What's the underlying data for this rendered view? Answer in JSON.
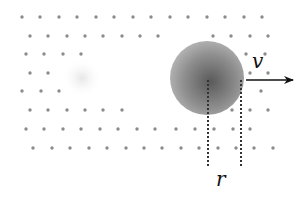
{
  "diagram": {
    "type": "physics-schematic",
    "labels": {
      "velocity": "v",
      "radius": "r"
    },
    "colors": {
      "background": "#ffffff",
      "particle": "#8c8c8c",
      "sphere_center": "#5a5a5a",
      "sphere_edge": "#b4b4b4",
      "ghost": "#ececec",
      "arrow": "#111111",
      "dashed_line": "#333333"
    },
    "sphere": {
      "cx": 207,
      "cy": 78,
      "r": 37
    },
    "ghost": {
      "cx": 82,
      "cy": 78,
      "r": 20
    },
    "arrow": {
      "x1": 246,
      "y1": 80,
      "x2": 293,
      "y2": 80
    },
    "dashed_lines": [
      {
        "x": 208,
        "y1": 80,
        "y2": 168
      },
      {
        "x": 241,
        "y1": 80,
        "y2": 168
      }
    ],
    "particles": [
      [
        22,
        17
      ],
      [
        40,
        17
      ],
      [
        59,
        17
      ],
      [
        77,
        17
      ],
      [
        96,
        17
      ],
      [
        114,
        17
      ],
      [
        133,
        17
      ],
      [
        151,
        17
      ],
      [
        170,
        17
      ],
      [
        188,
        17
      ],
      [
        207,
        17
      ],
      [
        225,
        17
      ],
      [
        244,
        17
      ],
      [
        262,
        17
      ],
      [
        30,
        36
      ],
      [
        48,
        36
      ],
      [
        67,
        36
      ],
      [
        85,
        36
      ],
      [
        103,
        36
      ],
      [
        122,
        36
      ],
      [
        140,
        36
      ],
      [
        158,
        36
      ],
      [
        213,
        36
      ],
      [
        231,
        36
      ],
      [
        250,
        36
      ],
      [
        268,
        36
      ],
      [
        26,
        54
      ],
      [
        44,
        54
      ],
      [
        63,
        54
      ],
      [
        81,
        54
      ],
      [
        246,
        54
      ],
      [
        265,
        54
      ],
      [
        30,
        73
      ],
      [
        48,
        73
      ],
      [
        250,
        73
      ],
      [
        268,
        73
      ],
      [
        22,
        91
      ],
      [
        41,
        91
      ],
      [
        59,
        91
      ],
      [
        261,
        91
      ],
      [
        30,
        110
      ],
      [
        48,
        110
      ],
      [
        67,
        110
      ],
      [
        85,
        110
      ],
      [
        103,
        110
      ],
      [
        122,
        110
      ],
      [
        232,
        110
      ],
      [
        250,
        110
      ],
      [
        268,
        110
      ],
      [
        26,
        129
      ],
      [
        44,
        129
      ],
      [
        63,
        129
      ],
      [
        81,
        129
      ],
      [
        100,
        129
      ],
      [
        118,
        129
      ],
      [
        137,
        129
      ],
      [
        155,
        129
      ],
      [
        176,
        129
      ],
      [
        195,
        129
      ],
      [
        214,
        129
      ],
      [
        233,
        129
      ],
      [
        250,
        129
      ],
      [
        33,
        148
      ],
      [
        52,
        148
      ],
      [
        70,
        148
      ],
      [
        89,
        148
      ],
      [
        107,
        148
      ],
      [
        126,
        148
      ],
      [
        144,
        148
      ],
      [
        162,
        148
      ],
      [
        181,
        148
      ],
      [
        199,
        148
      ],
      [
        218,
        148
      ],
      [
        236,
        148
      ],
      [
        254,
        148
      ],
      [
        273,
        148
      ]
    ]
  }
}
